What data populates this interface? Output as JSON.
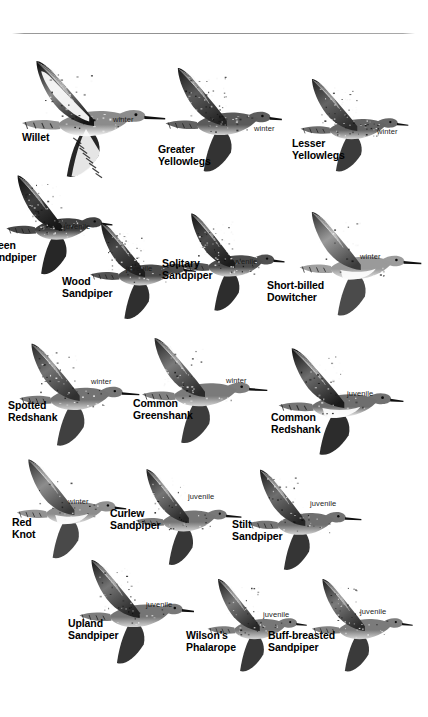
{
  "page": {
    "kind": "field-guide-plate",
    "background_color": "#ffffff",
    "rule_color": "#8e8e8e"
  },
  "birds": [
    {
      "id": "willet",
      "name": "Willet",
      "plumage": "winter",
      "name_pos": {
        "x": 22,
        "y": 132
      },
      "plumage_pos": {
        "x": 113,
        "y": 116
      },
      "figure": {
        "x": 6,
        "y": 52,
        "w": 160,
        "h": 148
      },
      "style": "bold-pied",
      "clipped": false,
      "body_tone": "#8b8b8b",
      "wing_tone": "#141414"
    },
    {
      "id": "greater-yellowlegs",
      "name": "Greater\nYellowlegs",
      "plumage": "winter",
      "name_pos": {
        "x": 158,
        "y": 144
      },
      "plumage_pos": {
        "x": 254,
        "y": 125
      },
      "figure": {
        "x": 152,
        "y": 60,
        "w": 136,
        "h": 132
      },
      "style": "dark-speckled",
      "clipped": false,
      "body_tone": "#5a5a5a",
      "wing_tone": "#222222"
    },
    {
      "id": "lesser-yellowlegs",
      "name": "Lesser\nYellowlegs",
      "plumage": "winter",
      "name_pos": {
        "x": 292,
        "y": 138
      },
      "plumage_pos": {
        "x": 377,
        "y": 128
      },
      "figure": {
        "x": 288,
        "y": 72,
        "w": 126,
        "h": 118
      },
      "style": "dark-speckled",
      "clipped": false,
      "body_tone": "#646464",
      "wing_tone": "#2a2a2a"
    },
    {
      "id": "green-sandpiper",
      "name": "Green\nSandpiper",
      "plumage": "juvenile",
      "name_pos": {
        "x": -14,
        "y": 240
      },
      "plumage_pos": {
        "x": 64,
        "y": 223
      },
      "figure": {
        "x": -6,
        "y": 168,
        "w": 124,
        "h": 126
      },
      "style": "very-dark",
      "clipped": true,
      "body_tone": "#3e3e3e",
      "wing_tone": "#151515"
    },
    {
      "id": "wood-sandpiper",
      "name": "Wood\nSandpiper",
      "plumage": "juvenile",
      "name_pos": {
        "x": 62,
        "y": 276
      },
      "plumage_pos": {
        "x": 126,
        "y": 265
      },
      "figure": {
        "x": 78,
        "y": 216,
        "w": 122,
        "h": 122
      },
      "style": "dark-speckled",
      "clipped": false,
      "body_tone": "#4a4a4a",
      "wing_tone": "#1d1d1d"
    },
    {
      "id": "solitary-sandpiper",
      "name": "Solitary\nSandpiper",
      "plumage": "juvenile",
      "name_pos": {
        "x": 162,
        "y": 258
      },
      "plumage_pos": {
        "x": 231,
        "y": 258
      },
      "figure": {
        "x": 168,
        "y": 206,
        "w": 122,
        "h": 124
      },
      "style": "dark-speckled",
      "clipped": false,
      "body_tone": "#4c4c4c",
      "wing_tone": "#1b1b1b"
    },
    {
      "id": "short-billed-dowitcher",
      "name": "Short-billed\nDowitcher",
      "plumage": "winter",
      "name_pos": {
        "x": 267,
        "y": 280
      },
      "plumage_pos": {
        "x": 360,
        "y": 253
      },
      "figure": {
        "x": 286,
        "y": 204,
        "w": 136,
        "h": 132
      },
      "style": "pale-gray",
      "clipped": false,
      "body_tone": "#9a9a9a",
      "wing_tone": "#3c3c3c"
    },
    {
      "id": "spotted-redshank",
      "name": "Spotted\nRedshank",
      "plumage": "winter",
      "name_pos": {
        "x": 8,
        "y": 400
      },
      "plumage_pos": {
        "x": 91,
        "y": 378
      },
      "figure": {
        "x": 6,
        "y": 336,
        "w": 134,
        "h": 130
      },
      "style": "mid-gray",
      "clipped": false,
      "body_tone": "#737373",
      "wing_tone": "#303030"
    },
    {
      "id": "common-greenshank",
      "name": "Common\nGreenshank",
      "plumage": "winter",
      "name_pos": {
        "x": 133,
        "y": 398
      },
      "plumage_pos": {
        "x": 226,
        "y": 377
      },
      "figure": {
        "x": 128,
        "y": 330,
        "w": 140,
        "h": 134
      },
      "style": "mid-gray",
      "clipped": false,
      "body_tone": "#7a7a7a",
      "wing_tone": "#2b2b2b"
    },
    {
      "id": "common-redshank",
      "name": "Common\nRedshank",
      "plumage": "juvenile",
      "name_pos": {
        "x": 271,
        "y": 412
      },
      "plumage_pos": {
        "x": 347,
        "y": 390
      },
      "figure": {
        "x": 264,
        "y": 340,
        "w": 146,
        "h": 136
      },
      "style": "white-belly",
      "clipped": false,
      "body_tone": "#6e6e6e",
      "wing_tone": "#1a1a1a"
    },
    {
      "id": "red-knot",
      "name": "Red\nKnot",
      "plumage": "winter",
      "name_pos": {
        "x": 12,
        "y": 517
      },
      "plumage_pos": {
        "x": 68,
        "y": 498
      },
      "figure": {
        "x": 4,
        "y": 452,
        "w": 128,
        "h": 126
      },
      "style": "pale-gray",
      "clipped": false,
      "body_tone": "#8d8d8d",
      "wing_tone": "#3a3a3a"
    },
    {
      "id": "curlew-sandpiper",
      "name": "Curlew\nSandpiper",
      "plumage": "juvenile",
      "name_pos": {
        "x": 110,
        "y": 508
      },
      "plumage_pos": {
        "x": 188,
        "y": 493
      },
      "figure": {
        "x": 124,
        "y": 462,
        "w": 118,
        "h": 122
      },
      "style": "mid-gray",
      "clipped": false,
      "body_tone": "#757575",
      "wing_tone": "#262626"
    },
    {
      "id": "stilt-sandpiper",
      "name": "Stilt\nSandpiper",
      "plumage": "juvenile",
      "name_pos": {
        "x": 232,
        "y": 519
      },
      "plumage_pos": {
        "x": 310,
        "y": 500
      },
      "figure": {
        "x": 236,
        "y": 462,
        "w": 126,
        "h": 128
      },
      "style": "mid-gray",
      "clipped": false,
      "body_tone": "#6f6f6f",
      "wing_tone": "#242424"
    },
    {
      "id": "upland-sandpiper",
      "name": "Upland\nSandpiper",
      "plumage": "juvenile",
      "name_pos": {
        "x": 68,
        "y": 618
      },
      "plumage_pos": {
        "x": 146,
        "y": 601
      },
      "figure": {
        "x": 66,
        "y": 552,
        "w": 134,
        "h": 132
      },
      "style": "mid-gray",
      "clipped": false,
      "body_tone": "#757575",
      "wing_tone": "#232323"
    },
    {
      "id": "wilsons-phalarope",
      "name": "Wilson's\nPhalarope",
      "plumage": "juvenile",
      "name_pos": {
        "x": 186,
        "y": 630
      },
      "plumage_pos": {
        "x": 263,
        "y": 611
      },
      "figure": {
        "x": 196,
        "y": 572,
        "w": 116,
        "h": 118
      },
      "style": "mid-gray",
      "clipped": false,
      "body_tone": "#777777",
      "wing_tone": "#272727"
    },
    {
      "id": "buff-breasted-sandpiper",
      "name": "Buff-breasted\nSandpiper",
      "plumage": "juvenile",
      "name_pos": {
        "x": 268,
        "y": 630
      },
      "plumage_pos": {
        "x": 360,
        "y": 608
      },
      "figure": {
        "x": 300,
        "y": 572,
        "w": 118,
        "h": 118
      },
      "style": "mid-gray",
      "clipped": false,
      "body_tone": "#7b7b7b",
      "wing_tone": "#292929"
    }
  ]
}
